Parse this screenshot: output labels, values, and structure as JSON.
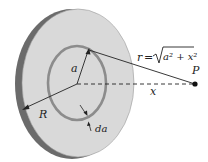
{
  "diagram": {
    "labels": {
      "radius_outer": "R",
      "radius_ring": "a",
      "ring_width": "da",
      "axis_distance": "x",
      "point": "P",
      "distance_eq_lhs": "r =",
      "distance_eq_rad": "a² + x²"
    },
    "colors": {
      "disk_face": "#d9d9d9",
      "disk_edge": "#6b6b6b",
      "ring": "#8c8c8c",
      "lines": "#222222"
    }
  }
}
